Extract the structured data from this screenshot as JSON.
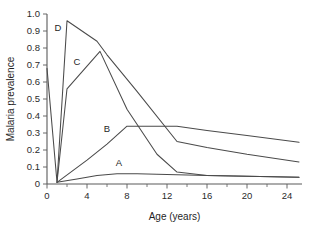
{
  "chart_data": {
    "type": "line",
    "title": "",
    "xlabel": "Age (years)",
    "ylabel": "Malaria prevalence",
    "xlim": [
      0,
      25.5
    ],
    "ylim": [
      0,
      1.0
    ],
    "grid": false,
    "legend": "inline-curve-labels",
    "x_ticks": [
      0,
      4,
      8,
      12,
      16,
      20,
      24
    ],
    "x_tick_labels": [
      "0",
      "4",
      "8",
      "12",
      "16",
      "20",
      "24"
    ],
    "x_minor_ticks": [
      2,
      6,
      10,
      14,
      18,
      22
    ],
    "y_ticks": [
      0,
      0.1,
      0.2,
      0.3,
      0.4,
      0.5,
      0.6,
      0.7,
      0.8,
      0.9,
      1.0
    ],
    "y_tick_labels": [
      "0",
      "0.1",
      "0.2",
      "0.3",
      "0.4",
      "0.5",
      "0.6",
      "0.7",
      "0.8",
      "0.9",
      "1.0"
    ],
    "series": [
      {
        "name": "A",
        "label": "A",
        "label_x": 7.2,
        "label_y": 0.105,
        "x": [
          1,
          3,
          5,
          7,
          9,
          13,
          16,
          20,
          25.2
        ],
        "values": [
          0.01,
          0.03,
          0.05,
          0.06,
          0.06,
          0.055,
          0.05,
          0.045,
          0.04
        ]
      },
      {
        "name": "B",
        "label": "B",
        "label_x": 6.0,
        "label_y": 0.305,
        "x": [
          1,
          4,
          6,
          8,
          13,
          16,
          20,
          25.2
        ],
        "values": [
          0.01,
          0.14,
          0.235,
          0.34,
          0.34,
          0.315,
          0.285,
          0.245
        ]
      },
      {
        "name": "C",
        "label": "C",
        "label_x": 3.0,
        "label_y": 0.7,
        "x": [
          1,
          2,
          5.3,
          8,
          11,
          13,
          16,
          20,
          25.2
        ],
        "values": [
          0.01,
          0.56,
          0.78,
          0.44,
          0.175,
          0.07,
          0.05,
          0.045,
          0.04
        ]
      },
      {
        "name": "D",
        "label": "D",
        "label_x": 1.1,
        "label_y": 0.9,
        "x": [
          0,
          1,
          2,
          5,
          6,
          9,
          13,
          16,
          20,
          25.2
        ],
        "values": [
          0.68,
          0.01,
          0.96,
          0.84,
          0.76,
          0.545,
          0.25,
          0.215,
          0.175,
          0.13
        ]
      }
    ]
  }
}
